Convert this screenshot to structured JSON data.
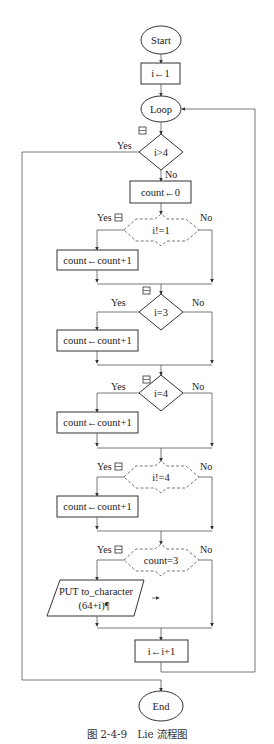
{
  "flowchart": {
    "start": "Start",
    "init": "i←1",
    "loop": "Loop",
    "cond_main": "i>4",
    "reset": "count←0",
    "conditions": [
      {
        "label": "i!=1",
        "style": "dashed"
      },
      {
        "label": "i=3",
        "style": "solid"
      },
      {
        "label": "i=4",
        "style": "solid"
      },
      {
        "label": "i!=4",
        "style": "dashed"
      },
      {
        "label": "count=3",
        "style": "dashed"
      }
    ],
    "increment_count": "count←count+1",
    "output_line1": "PUT to_character",
    "output_line2": "(64+i)¶",
    "increment_i": "i←i+1",
    "end": "End",
    "yes": "Yes",
    "no": "No"
  },
  "caption": "图 2-4-9　Lie 流程图"
}
